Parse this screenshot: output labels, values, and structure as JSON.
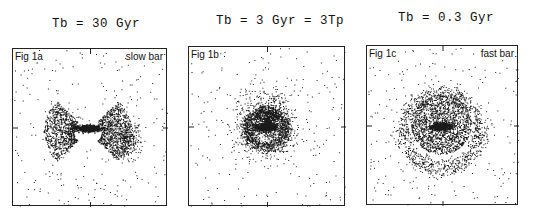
{
  "figure": {
    "panels": [
      {
        "title": "Tb = 30 Gyr",
        "label": "Fig 1a",
        "annotation": "slow bar",
        "morphology": "bar with two fan-shaped lobes, sparse halo",
        "box": {
          "x": 12,
          "y": 48,
          "w": 155,
          "h": 158
        },
        "title_pos": {
          "x": 52,
          "y": 18
        }
      },
      {
        "title": "Tb = 3 Gyr = 3Tp",
        "label": "Fig 1b",
        "annotation": "",
        "morphology": "central bar inside oval ring, extended disk",
        "box": {
          "x": 188,
          "y": 46,
          "w": 157,
          "h": 160
        },
        "title_pos": {
          "x": 216,
          "y": 15
        }
      },
      {
        "title": "Tb = 0.3 Gyr",
        "label": "Fig 1c",
        "annotation": "fast bar",
        "morphology": "compact bar inside round disk with outer ring",
        "box": {
          "x": 366,
          "y": 45,
          "w": 152,
          "h": 160
        },
        "title_pos": {
          "x": 398,
          "y": 12
        }
      }
    ]
  }
}
